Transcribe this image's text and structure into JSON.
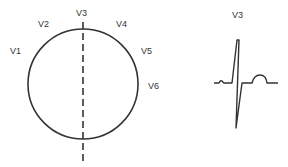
{
  "diagram": {
    "circle_labels": [
      {
        "text": "V1",
        "x": 10,
        "y": 54
      },
      {
        "text": "V2",
        "x": 38,
        "y": 27
      },
      {
        "text": "V3",
        "x": 77,
        "y": 16
      },
      {
        "text": "V4",
        "x": 116,
        "y": 27
      },
      {
        "text": "V5",
        "x": 141,
        "y": 54
      },
      {
        "text": "V6",
        "x": 148,
        "y": 88
      }
    ],
    "waveform_label": "V3",
    "colors": {
      "stroke": "#333333",
      "background": "#ffffff"
    }
  }
}
